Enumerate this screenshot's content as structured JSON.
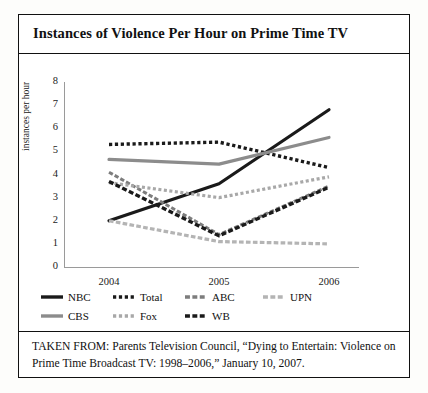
{
  "figure": {
    "title": "Instances of Violence Per Hour on Prime Time TV",
    "source": "TAKEN FROM: Parents Television Council, “Dying to Entertain: Violence on Prime Time Broadcast TV: 1998–2006,” January 10, 2007."
  },
  "chart_data": {
    "type": "line",
    "title": "Instances of Violence Per Hour on Prime Time TV",
    "xlabel": "",
    "ylabel": "instances per hour",
    "categories": [
      "2004",
      "2005",
      "2006"
    ],
    "x": [
      2004,
      2005,
      2006
    ],
    "ylim": [
      0,
      8
    ],
    "yticks": [
      0,
      1,
      2,
      3,
      4,
      5,
      6,
      7,
      8
    ],
    "grid": false,
    "legend_position": "below-plot",
    "series": [
      {
        "name": "NBC",
        "values": [
          2.0,
          3.6,
          6.8
        ],
        "color": "#1a1a1a",
        "style": "solid",
        "width": 3.2
      },
      {
        "name": "Total",
        "values": [
          5.3,
          5.4,
          4.3
        ],
        "color": "#1a1a1a",
        "style": "dotted",
        "width": 3.4
      },
      {
        "name": "ABC",
        "values": [
          4.1,
          1.4,
          3.5
        ],
        "color": "#7d7d7d",
        "style": "dashed",
        "width": 3.0
      },
      {
        "name": "UPN",
        "values": [
          2.0,
          1.1,
          1.0
        ],
        "color": "#b4b4b4",
        "style": "dashed",
        "width": 3.2
      },
      {
        "name": "CBS",
        "values": [
          4.65,
          4.45,
          5.6
        ],
        "color": "#8c8c8c",
        "style": "solid",
        "width": 3.2
      },
      {
        "name": "Fox",
        "values": [
          3.65,
          3.0,
          3.9
        ],
        "color": "#a8a8a8",
        "style": "dotted",
        "width": 3.2
      },
      {
        "name": "WB",
        "values": [
          3.7,
          1.35,
          3.45
        ],
        "color": "#1a1a1a",
        "style": "dashed",
        "width": 3.4
      }
    ]
  },
  "legend": {
    "rows": [
      [
        {
          "label": "NBC",
          "color": "#1a1a1a",
          "style": "solid"
        },
        {
          "label": "Total",
          "color": "#1a1a1a",
          "style": "dotted"
        },
        {
          "label": "ABC",
          "color": "#7d7d7d",
          "style": "dashed"
        },
        {
          "label": "UPN",
          "color": "#b4b4b4",
          "style": "dashed"
        }
      ],
      [
        {
          "label": "CBS",
          "color": "#8c8c8c",
          "style": "solid"
        },
        {
          "label": "Fox",
          "color": "#a8a8a8",
          "style": "dotted"
        },
        {
          "label": "WB",
          "color": "#1a1a1a",
          "style": "dashed"
        }
      ]
    ]
  }
}
